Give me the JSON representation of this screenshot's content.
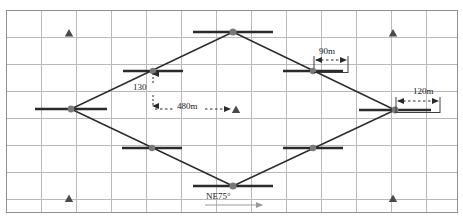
{
  "figure": {
    "type": "survey-traverse-diagram",
    "width": 463,
    "height": 219,
    "background_color": "#ffffff"
  },
  "colors": {
    "grid_line": "#b9b9b9",
    "frame": "#8f8f8f",
    "traverse_line": "#2b2b2b",
    "station_bar": "#2b2b2b",
    "station_dot": "#7a7a7a",
    "dimension_line": "#3a3a3a",
    "triangle_marker": "#4a4a4a",
    "text": "#1a1a1a",
    "azimuth_arrow": "#9a9a9a"
  },
  "grid": {
    "frame": {
      "x": 6,
      "y": 10,
      "width": 452,
      "height": 203
    },
    "vertical_lines_x": [
      41,
      76,
      111,
      146,
      181,
      216,
      251,
      286,
      321,
      356,
      391,
      426
    ],
    "horizontal_lines_y": [
      37,
      64,
      91,
      118,
      145,
      172,
      199
    ]
  },
  "labels": {
    "offset_130": "130",
    "baseline_480m": "480m",
    "spacing_90m": "90m",
    "spacing_120m": "120m",
    "azimuth_ne75": "NE75°"
  },
  "stations": [
    {
      "name": "west-vertex",
      "x": 71,
      "y": 109,
      "bar_half_width": 36,
      "role": "vertex"
    },
    {
      "name": "north-vertex",
      "x": 233,
      "y": 32,
      "bar_half_width": 40,
      "role": "vertex"
    },
    {
      "name": "east-vertex",
      "x": 395,
      "y": 110,
      "bar_half_width": 36,
      "role": "vertex"
    },
    {
      "name": "south-vertex",
      "x": 233,
      "y": 186,
      "bar_half_width": 40,
      "role": "vertex"
    },
    {
      "name": "northwest-station",
      "x": 153,
      "y": 71,
      "bar_half_width": 30,
      "role": "intermediate"
    },
    {
      "name": "northeast-station",
      "x": 313,
      "y": 71,
      "bar_half_width": 30,
      "role": "intermediate"
    },
    {
      "name": "southwest-station",
      "x": 152,
      "y": 148,
      "bar_half_width": 30,
      "role": "intermediate"
    },
    {
      "name": "southeast-station",
      "x": 313,
      "y": 148,
      "bar_half_width": 30,
      "role": "intermediate"
    }
  ],
  "control_points": [
    {
      "name": "control-point-top-left",
      "x": 69,
      "y": 34
    },
    {
      "name": "control-point-top-right",
      "x": 393,
      "y": 34
    },
    {
      "name": "control-point-center",
      "x": 236,
      "y": 110
    },
    {
      "name": "control-point-bottom-left",
      "x": 69,
      "y": 200
    },
    {
      "name": "control-point-bottom-right",
      "x": 393,
      "y": 200
    }
  ],
  "traverse_edges": [
    {
      "name": "edge-west-to-north",
      "from": "west-vertex",
      "to": "north-vertex"
    },
    {
      "name": "edge-north-to-east",
      "from": "north-vertex",
      "to": "east-vertex"
    },
    {
      "name": "edge-east-to-south",
      "from": "east-vertex",
      "to": "south-vertex"
    },
    {
      "name": "edge-south-to-west",
      "from": "south-vertex",
      "to": "west-vertex"
    }
  ],
  "dimensions": [
    {
      "name": "dimension-480m",
      "label": "480m",
      "style": "dashed-single-arrow",
      "from_x": 153,
      "to_x": 232,
      "y": 109
    },
    {
      "name": "dimension-130-offset",
      "label": "130",
      "style": "dashed-vertical-arrow",
      "x": 153,
      "from_y": 76,
      "to_y": 106
    },
    {
      "name": "dimension-90m",
      "label": "90m",
      "style": "dashed-double-arrow",
      "from_x": 314,
      "to_x": 348,
      "y": 60
    },
    {
      "name": "dimension-120m",
      "label": "120m",
      "style": "dashed-double-arrow",
      "from_x": 396,
      "to_x": 440,
      "y": 101
    },
    {
      "name": "azimuth-ne75",
      "label": "NE75°",
      "style": "solid-single-arrow",
      "from_x": 205,
      "to_x": 262,
      "y": 205
    }
  ]
}
